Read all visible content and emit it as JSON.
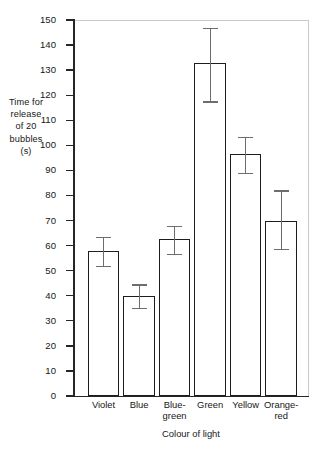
{
  "chart_data": {
    "type": "bar",
    "title": "",
    "subtitle": "",
    "xlabel": "Colour of light",
    "ylabel": "Time for release of 20 bubbles (s)",
    "ylabel_lines": [
      "Time for",
      "release",
      "of 20",
      "bubbles",
      "(s)"
    ],
    "categories": [
      "Violet",
      "Blue",
      "Blue-green",
      "Green",
      "Yellow",
      "Orange-red"
    ],
    "category_label_lines": [
      [
        "Violet"
      ],
      [
        "Blue"
      ],
      [
        "Blue-",
        "green"
      ],
      [
        "Green"
      ],
      [
        "Yellow"
      ],
      [
        "Orange-",
        "red"
      ]
    ],
    "values": [
      58,
      40,
      62.5,
      133,
      96.5,
      70
    ],
    "error_low": [
      52,
      35,
      56.5,
      117.5,
      89,
      58.5
    ],
    "error_high": [
      63.5,
      44.5,
      68,
      147,
      103.5,
      82
    ],
    "ylim": [
      0,
      150
    ],
    "ytick_step": 10,
    "yticks": [
      0,
      10,
      20,
      30,
      40,
      50,
      60,
      70,
      80,
      90,
      100,
      110,
      120,
      130,
      140,
      150
    ],
    "ytick_labels": [
      "0",
      "10",
      "20",
      "30",
      "40",
      "50",
      "60",
      "70",
      "80",
      "90",
      "100",
      "110",
      "120",
      "130",
      "140",
      "150"
    ],
    "grid": false,
    "legend": null,
    "bar_fill_color": "#ffffff",
    "bar_edge_color": "#1c1c1c",
    "error_bar_color": "#6d6d6d",
    "axis_color": "#262626",
    "frame_color": "#c9c9c9",
    "background_color": "#ffffff"
  }
}
